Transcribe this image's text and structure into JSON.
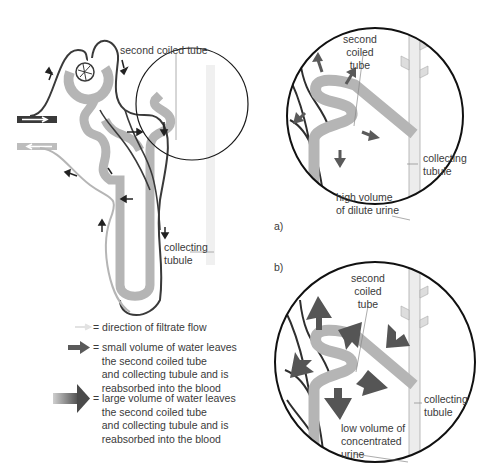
{
  "figure": {
    "overview": {
      "label_second_coiled_tube": "second coiled tube",
      "label_collecting_tubule": "collecting\ntubule"
    },
    "panel_a": {
      "tag": "a)",
      "label_second_coiled_tube": "second\ncoiled\ntube",
      "label_collecting_tubule": "collecting\ntubule",
      "label_urine": "high volume\nof dilute urine"
    },
    "panel_b": {
      "tag": "b)",
      "label_second_coiled_tube": "second\ncoiled\ntube",
      "label_collecting_tubule": "collecting\ntubule",
      "label_urine": "low volume of\nconcentrated\nurine"
    },
    "legend": [
      {
        "icon": "white-flow-arrow-icon",
        "text": "= direction of filtrate flow"
      },
      {
        "icon": "small-grey-arrow-icon",
        "text": "= small volume of water leaves\n   the second coiled tube\n   and collecting tubule and is\n   reabsorbed into the blood"
      },
      {
        "icon": "large-grey-arrow-icon",
        "text": "= large volume of water leaves\n   the second coiled tube\n   and collecting tubule and is\n   reabsorbed into the blood"
      }
    ],
    "colors": {
      "blood_vessel": "#3a3a3a",
      "tubule": "#b5b5b5",
      "water_arrow": "#5a5a5a",
      "outline": "#1a1a1a"
    }
  }
}
